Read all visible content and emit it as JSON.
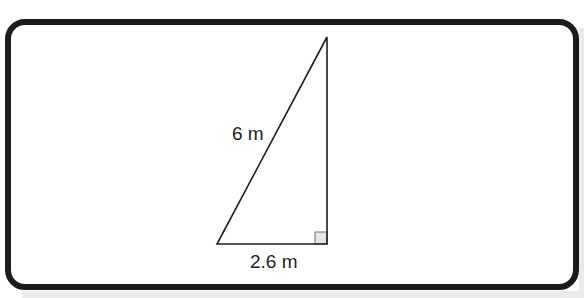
{
  "figure": {
    "shape": "right-triangle",
    "hypotenuse_label": "6 m",
    "base_label": "2.6 m",
    "right_angle_marker": "square",
    "vertices": {
      "bottom_left": [
        217,
        244
      ],
      "bottom_right": [
        327,
        244
      ],
      "top": [
        327,
        37
      ]
    },
    "colors": {
      "stroke": "#1c1c1c",
      "frame_border": "#1c1c1c",
      "right_angle_fill": "#e6e6e6",
      "background": "#ffffff",
      "shadow": "#ebebeb"
    }
  }
}
